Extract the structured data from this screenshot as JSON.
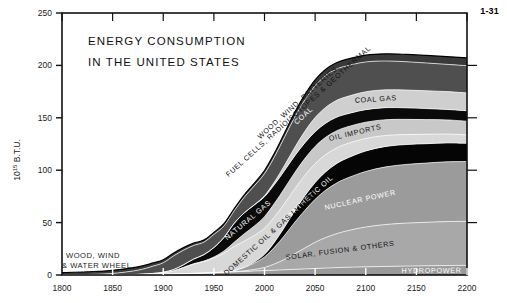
{
  "figure": {
    "number": "1-31"
  },
  "chart_data": {
    "type": "area",
    "title": "ENERGY CONSUMPTION IN THE UNITED STATES",
    "title_lines": [
      "ENERGY  CONSUMPTION",
      "IN  THE  UNITED  STATES"
    ],
    "xlabel": "",
    "ylabel": "10^15 B.T.U.",
    "ylabel_parts": {
      "base": "10",
      "exponent": "15",
      "unit": " B.T.U."
    },
    "xlim": [
      1800,
      2200
    ],
    "ylim": [
      0,
      250
    ],
    "xticks": [
      1800,
      1850,
      1900,
      1950,
      2000,
      2050,
      2100,
      2150,
      2200
    ],
    "xtick_labels": [
      "1800",
      "1850",
      "1900",
      "1950",
      "2000",
      "2050",
      "2100",
      "2150",
      "2200"
    ],
    "yticks": [
      0,
      50,
      100,
      150,
      200,
      250
    ],
    "ytick_labels": [
      "0",
      "50",
      "100",
      "150",
      "200",
      "250"
    ],
    "grid": false,
    "legend": "inline-band-labels",
    "stacked": true,
    "x": [
      1800,
      1825,
      1850,
      1875,
      1890,
      1900,
      1910,
      1920,
      1930,
      1940,
      1950,
      1960,
      1970,
      1980,
      1990,
      2000,
      2010,
      2020,
      2030,
      2040,
      2050,
      2060,
      2070,
      2080,
      2100,
      2120,
      2140,
      2160,
      2180,
      2200
    ],
    "series": [
      {
        "name": "HYDROPOWER",
        "label": "HYDROPOWER",
        "color": "#9a9a9a",
        "label_color": "light",
        "values": [
          0,
          0,
          0,
          0.2,
          0.4,
          0.6,
          0.9,
          1.2,
          1.5,
          1.8,
          2.2,
          2.6,
          3.0,
          3.4,
          3.8,
          4.2,
          4.6,
          5.0,
          5.4,
          5.8,
          6.2,
          6.6,
          7.0,
          7.3,
          7.8,
          8.2,
          8.5,
          8.8,
          9.0,
          9.2
        ]
      },
      {
        "name": "SOLAR, FUSION & OTHERS",
        "label": "SOLAR, FUSION & OTHERS",
        "color": "#a8a8a8",
        "label_color": "dark",
        "values": [
          0,
          0,
          0,
          0,
          0,
          0,
          0,
          0,
          0,
          0,
          0,
          0,
          0.2,
          0.6,
          1.5,
          3.0,
          6.0,
          10.0,
          15.0,
          20.0,
          25.0,
          29.0,
          32.0,
          34.5,
          38.0,
          40.0,
          41.0,
          41.5,
          42.0,
          42.0
        ]
      },
      {
        "name": "NUCLEAR POWER",
        "label": "NUCLEAR POWER",
        "color": "#9b9b9b",
        "label_color": "light",
        "values": [
          0,
          0,
          0,
          0,
          0,
          0,
          0,
          0,
          0,
          0,
          0,
          0.3,
          1.0,
          3.0,
          6.0,
          10.0,
          16.0,
          23.0,
          30.0,
          36.0,
          41.0,
          45.0,
          48.0,
          50.0,
          53.0,
          55.0,
          56.0,
          56.5,
          57.0,
          57.0
        ]
      },
      {
        "name": "SYNTHETIC OIL",
        "label": "SYNTHETIC OIL",
        "color": "#050505",
        "label_color": "light",
        "values": [
          0,
          0,
          0,
          0,
          0,
          0,
          0,
          0,
          0,
          0,
          0,
          0,
          0,
          0.3,
          1.0,
          2.5,
          5.0,
          8.0,
          11.0,
          14.0,
          16.0,
          17.5,
          18.5,
          19.0,
          19.5,
          19.5,
          19.0,
          18.5,
          18.0,
          17.5
        ]
      },
      {
        "name": "DOMESTIC OIL & GAS LIQUIDS",
        "label": "DOMESTIC OIL & GAS LIQUIDS",
        "color": "#d8d8d8",
        "label_color": "dark",
        "values": [
          0,
          0,
          0,
          0.3,
          0.8,
          1.5,
          3.0,
          6.0,
          9.0,
          11.0,
          14.0,
          18.0,
          23.0,
          25.0,
          25.5,
          25.0,
          24.0,
          22.5,
          21.0,
          19.5,
          18.0,
          16.5,
          15.0,
          14.0,
          12.0,
          10.5,
          9.5,
          9.0,
          8.5,
          8.0
        ]
      },
      {
        "name": "OIL IMPORTS",
        "label": "OIL IMPORTS",
        "color": "#c8c8c8",
        "label_color": "dark",
        "values": [
          0,
          0,
          0,
          0,
          0,
          0,
          0,
          0,
          0.2,
          0.5,
          1.0,
          2.0,
          4.0,
          7.0,
          9.0,
          11.0,
          13.0,
          14.5,
          15.5,
          16.0,
          16.5,
          16.5,
          16.5,
          16.0,
          15.5,
          15.0,
          14.5,
          14.0,
          13.5,
          13.0
        ]
      },
      {
        "name": "NATURAL GAS",
        "label": "NATURAL GAS",
        "color": "#0a0a0a",
        "label_color": "light",
        "values": [
          0,
          0,
          0,
          0.1,
          0.3,
          0.6,
          1.2,
          2.5,
          4.5,
          6.0,
          9.0,
          13.0,
          18.0,
          20.0,
          20.0,
          19.0,
          18.0,
          17.0,
          16.0,
          15.0,
          14.0,
          13.5,
          13.0,
          12.5,
          12.0,
          11.5,
          11.0,
          10.5,
          10.0,
          10.0
        ]
      },
      {
        "name": "COAL GAS",
        "label": "COAL GAS",
        "color": "#cfcfcf",
        "label_color": "dark",
        "values": [
          0,
          0,
          0,
          0,
          0,
          0,
          0,
          0,
          0,
          0,
          0,
          0,
          0,
          0,
          0.3,
          1.0,
          2.5,
          5.0,
          8.0,
          11.0,
          13.5,
          15.0,
          16.0,
          16.5,
          17.0,
          17.0,
          17.0,
          17.0,
          17.0,
          17.0
        ]
      },
      {
        "name": "COAL",
        "label": "COAL",
        "color": "#4f4f4f",
        "label_color": "light",
        "values": [
          0.2,
          0.5,
          1.5,
          4.0,
          7.0,
          9.0,
          13.0,
          14.0,
          13.0,
          12.0,
          12.5,
          11.0,
          12.0,
          15.0,
          18.0,
          21.0,
          24.0,
          27.0,
          29.0,
          30.0,
          30.5,
          30.5,
          30.0,
          29.5,
          28.5,
          27.5,
          27.0,
          26.5,
          26.0,
          26.0
        ]
      },
      {
        "name": "WOOD, WIND, BATTERIES, FUEL CELLS, RADIOISOTOPES & GEOTHERMAL",
        "label": "WOOD, WIND, BATTERIES,",
        "label2": "FUEL CELLS, RADIOISOTOPES & GEOTHERMAL",
        "color": "#3a3a3a",
        "label_color": "dark",
        "values": [
          2.0,
          2.6,
          3.0,
          3.2,
          3.0,
          2.8,
          2.6,
          2.4,
          2.2,
          2.0,
          2.0,
          2.0,
          2.0,
          2.2,
          2.5,
          3.0,
          3.5,
          4.0,
          4.5,
          5.0,
          5.5,
          5.8,
          6.0,
          6.2,
          6.5,
          6.8,
          7.0,
          7.2,
          7.4,
          7.5
        ]
      }
    ],
    "ground_annotation": {
      "label_line1": "WOOD, WIND",
      "label_line2": "& WATER WHEEL"
    },
    "total_at_2200": 200,
    "total_at_1800": 2.2
  }
}
